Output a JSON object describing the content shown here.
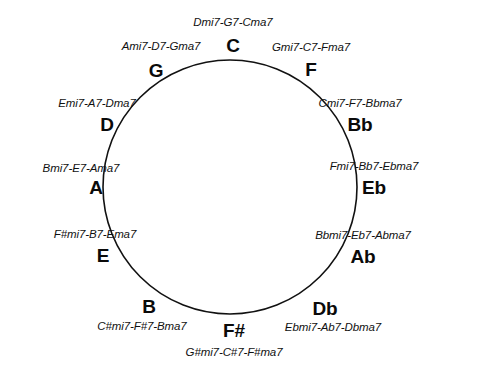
{
  "diagram": {
    "shape": "circle",
    "stroke_color": "#111111",
    "fill_color": "#ffffff",
    "background_color": "#ffffff",
    "text_color": "#0a0a0a"
  },
  "keys": [
    {
      "id": "c",
      "letter": "C",
      "progression": "Dmi7-G7-Cma7",
      "position": "top",
      "letter_x": 233,
      "letter_y": 45,
      "label_x": 233,
      "label_y": 23,
      "letter_anchor": "center",
      "label_anchor": "center"
    },
    {
      "id": "f",
      "letter": "F",
      "progression": "Gmi7-C7-Fma7",
      "position": "1-o-clock",
      "letter_x": 311,
      "letter_y": 69,
      "label_x": 311,
      "label_y": 48,
      "letter_anchor": "center",
      "label_anchor": "center"
    },
    {
      "id": "bb",
      "letter": "Bb",
      "progression": "Cmi7-F7-Bbma7",
      "position": "2-o-clock",
      "letter_x": 360,
      "letter_y": 124,
      "label_x": 360,
      "label_y": 104,
      "letter_anchor": "center",
      "label_anchor": "center"
    },
    {
      "id": "eb",
      "letter": "Eb",
      "progression": "Fmi7-Bb7-Ebma7",
      "position": "3-o-clock",
      "letter_x": 374,
      "letter_y": 187,
      "label_x": 374,
      "label_y": 167,
      "letter_anchor": "center",
      "label_anchor": "center"
    },
    {
      "id": "ab",
      "letter": "Ab",
      "progression": "Bbmi7-Eb7-Abma7",
      "position": "4-o-clock",
      "letter_x": 363,
      "letter_y": 256,
      "label_x": 363,
      "label_y": 236,
      "letter_anchor": "center",
      "label_anchor": "center"
    },
    {
      "id": "db",
      "letter": "Db",
      "progression": "Ebmi7-Ab7-Dbma7",
      "position": "5-o-clock",
      "letter_x": 325,
      "letter_y": 308,
      "label_x": 333,
      "label_y": 328,
      "letter_anchor": "center",
      "label_anchor": "center"
    },
    {
      "id": "fsharp",
      "letter": "F#",
      "progression": "G#mi7-C#7-F#ma7",
      "position": "bottom",
      "letter_x": 234,
      "letter_y": 330,
      "label_x": 234,
      "label_y": 353,
      "letter_anchor": "center",
      "label_anchor": "center"
    },
    {
      "id": "b",
      "letter": "B",
      "progression": "C#mi7-F#7-Bma7",
      "position": "7-o-clock",
      "letter_x": 149,
      "letter_y": 306,
      "label_x": 142,
      "label_y": 327,
      "letter_anchor": "center",
      "label_anchor": "center"
    },
    {
      "id": "e",
      "letter": "E",
      "progression": "F#mi7-B7-Ema7",
      "position": "8-o-clock",
      "letter_x": 103,
      "letter_y": 255,
      "label_x": 95,
      "label_y": 235,
      "letter_anchor": "center",
      "label_anchor": "center"
    },
    {
      "id": "a",
      "letter": "A",
      "progression": "Bmi7-E7-Ama7",
      "position": "9-o-clock",
      "letter_x": 96,
      "letter_y": 187,
      "label_x": 81,
      "label_y": 169,
      "letter_anchor": "center",
      "label_anchor": "center"
    },
    {
      "id": "d",
      "letter": "D",
      "progression": "Emi7-A7-Dma7",
      "position": "10-o-clock",
      "letter_x": 107,
      "letter_y": 124,
      "label_x": 97,
      "label_y": 104,
      "letter_anchor": "center",
      "label_anchor": "center"
    },
    {
      "id": "g",
      "letter": "G",
      "progression": "Ami7-D7-Gma7",
      "position": "11-o-clock",
      "letter_x": 156,
      "letter_y": 70,
      "label_x": 161,
      "label_y": 47,
      "letter_anchor": "center",
      "label_anchor": "center"
    }
  ],
  "circle_geometry": {
    "center_x": 230,
    "center_y": 187,
    "radius": 127,
    "stroke_width": 1.6
  }
}
